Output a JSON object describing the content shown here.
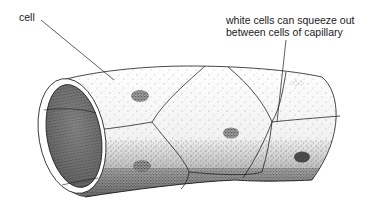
{
  "diagram": {
    "subject": "capillary",
    "style": "black-and-white stippled illustration",
    "colors": {
      "ink": "#1a1a1a",
      "background": "#ffffff",
      "stipple_dark": "#2a2a2a",
      "nucleus": "#555555"
    },
    "labels": {
      "cell": "cell",
      "white_cells_line1": "white cells can squeeze out",
      "white_cells_line2": "between cells of capillary"
    },
    "parts": [
      {
        "id": "tube-wall",
        "description": "capillary wall made of flattened endothelial cells"
      },
      {
        "id": "lumen-opening",
        "description": "open end of the capillary showing the interior"
      },
      {
        "id": "cell-boundaries",
        "description": "lines separating individual cells"
      },
      {
        "id": "nuclei",
        "count": 6,
        "description": "dark stippled nuclei of cells"
      }
    ]
  }
}
